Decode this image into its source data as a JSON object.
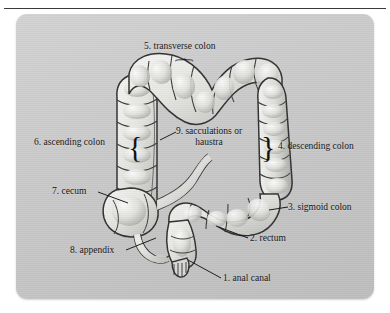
{
  "figure": {
    "title_clipped": "Digestive System: Large Intestine",
    "panel_color": "#c9c9c9",
    "labels": [
      {
        "id": "anal-canal",
        "number": "1.",
        "text": "1. anal canal"
      },
      {
        "id": "rectum",
        "number": "2.",
        "text": "2. rectum"
      },
      {
        "id": "sigmoid",
        "number": "3.",
        "text": "3. sigmoid colon"
      },
      {
        "id": "descending",
        "number": "4.",
        "text": "4. descending colon"
      },
      {
        "id": "transverse",
        "number": "5.",
        "text": "5. transverse colon"
      },
      {
        "id": "ascending",
        "number": "6.",
        "text": "6. ascending colon"
      },
      {
        "id": "cecum",
        "number": "7.",
        "text": "7. cecum"
      },
      {
        "id": "appendix",
        "number": "8.",
        "text": "8. appendix"
      },
      {
        "id": "haustra",
        "number": "9.",
        "text": "9. sacculations or haustra"
      }
    ],
    "braces": {
      "ascending": "{",
      "descending": "}",
      "transverse": "{"
    }
  }
}
